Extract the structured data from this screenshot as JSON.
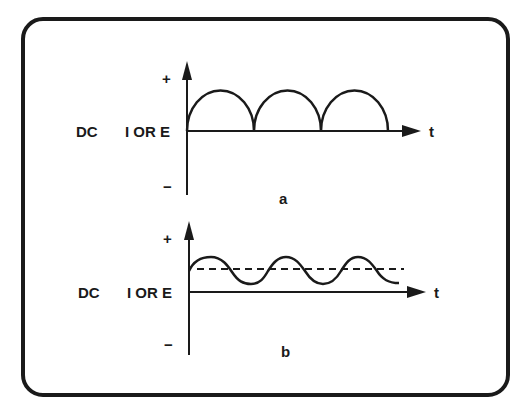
{
  "figure": {
    "panels": [
      {
        "id": "a",
        "caption": "a",
        "left_label_type": "DC",
        "left_label_quantity": "I OR E",
        "plus_label": "+",
        "minus_label": "−",
        "time_label": "t",
        "waveform": "full-wave rectified (pulsating DC)"
      },
      {
        "id": "b",
        "caption": "b",
        "left_label_type": "DC",
        "left_label_quantity": "I OR E",
        "plus_label": "+",
        "minus_label": "−",
        "time_label": "t",
        "waveform": "DC with ripple, dashed average level"
      }
    ]
  },
  "colors": {
    "ink": "#1a1a1a",
    "background": "#ffffff"
  }
}
